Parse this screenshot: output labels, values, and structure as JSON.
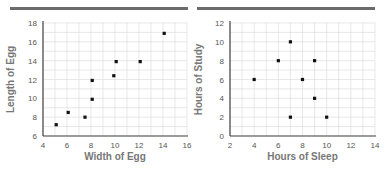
{
  "chart_data": [
    {
      "type": "scatter",
      "title": "",
      "xlabel": "Width of Egg",
      "ylabel": "Length of Egg",
      "xlim": [
        4,
        16
      ],
      "ylim": [
        6,
        18
      ],
      "xticks": [
        4,
        6,
        8,
        10,
        12,
        14,
        16
      ],
      "yticks": [
        6,
        8,
        10,
        12,
        14,
        16,
        18
      ],
      "grid": true,
      "points": [
        {
          "x": 5.1,
          "y": 7.2
        },
        {
          "x": 6.1,
          "y": 8.5
        },
        {
          "x": 7.5,
          "y": 8.0
        },
        {
          "x": 8.1,
          "y": 9.9
        },
        {
          "x": 8.1,
          "y": 11.9
        },
        {
          "x": 9.9,
          "y": 12.4
        },
        {
          "x": 10.1,
          "y": 13.9
        },
        {
          "x": 12.1,
          "y": 13.9
        },
        {
          "x": 14.1,
          "y": 16.9
        }
      ]
    },
    {
      "type": "scatter",
      "title": "",
      "xlabel": "Hours of Sleep",
      "ylabel": "Hours of Study",
      "xlim": [
        2,
        14
      ],
      "ylim": [
        0,
        12
      ],
      "xticks": [
        2,
        4,
        6,
        8,
        10,
        12,
        14
      ],
      "yticks": [
        0,
        2,
        4,
        6,
        8,
        10,
        12
      ],
      "grid": true,
      "points": [
        {
          "x": 4,
          "y": 6
        },
        {
          "x": 6,
          "y": 8
        },
        {
          "x": 7,
          "y": 10
        },
        {
          "x": 7,
          "y": 2
        },
        {
          "x": 8,
          "y": 6
        },
        {
          "x": 9,
          "y": 8
        },
        {
          "x": 9,
          "y": 4
        },
        {
          "x": 10,
          "y": 2
        }
      ]
    }
  ]
}
